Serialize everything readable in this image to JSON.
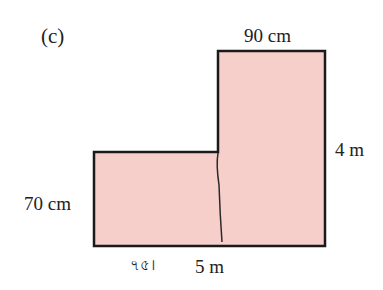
{
  "figure": {
    "label": "(c)",
    "shape": "L-shaped region",
    "fill_color": "#f6cfcb",
    "stroke_color": "#1a1a1a",
    "dimensions": {
      "top_width": "90 cm",
      "right_height": "4 m",
      "left_height": "70 cm",
      "bottom_width": "5 m"
    },
    "handwritten_note": "৭৫।"
  }
}
